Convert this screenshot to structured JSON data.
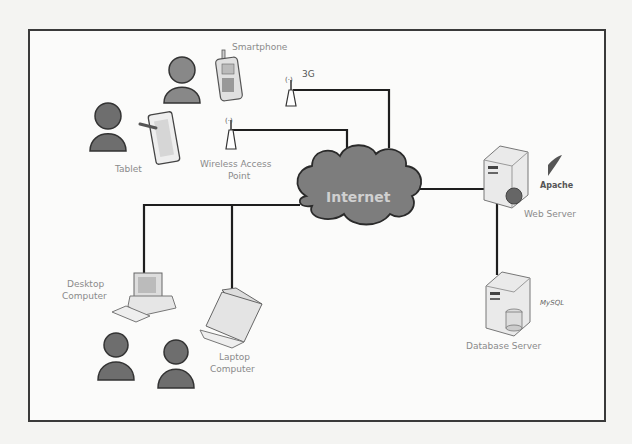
{
  "diagram": {
    "nodes": {
      "smartphone": {
        "label": "Smartphone"
      },
      "tablet": {
        "label": "Tablet"
      },
      "cell_tower": {
        "label": "3G"
      },
      "wap": {
        "label_line1": "Wireless Access",
        "label_line2": "Point"
      },
      "internet": {
        "label": "Internet"
      },
      "web_server": {
        "label": "Web Server",
        "logo": "Apache"
      },
      "db_server": {
        "label": "Database Server",
        "logo": "MySQL"
      },
      "desktop": {
        "label_line1": "Desktop",
        "label_line2": "Computer"
      },
      "laptop": {
        "label_line1": "Laptop",
        "label_line2": "Computer"
      }
    },
    "edges": [
      {
        "from": "3G",
        "to": "Internet"
      },
      {
        "from": "Wireless Access Point",
        "to": "Internet"
      },
      {
        "from": "Desktop Computer",
        "to": "Internet"
      },
      {
        "from": "Laptop Computer",
        "to": "Internet"
      },
      {
        "from": "Internet",
        "to": "Web Server"
      },
      {
        "from": "Web Server",
        "to": "Database Server"
      }
    ],
    "colors": {
      "line": "#1e1e1e",
      "cloud": "#7d7d7d",
      "person": "#6e6e6e",
      "border": "#3a3a3a"
    }
  }
}
